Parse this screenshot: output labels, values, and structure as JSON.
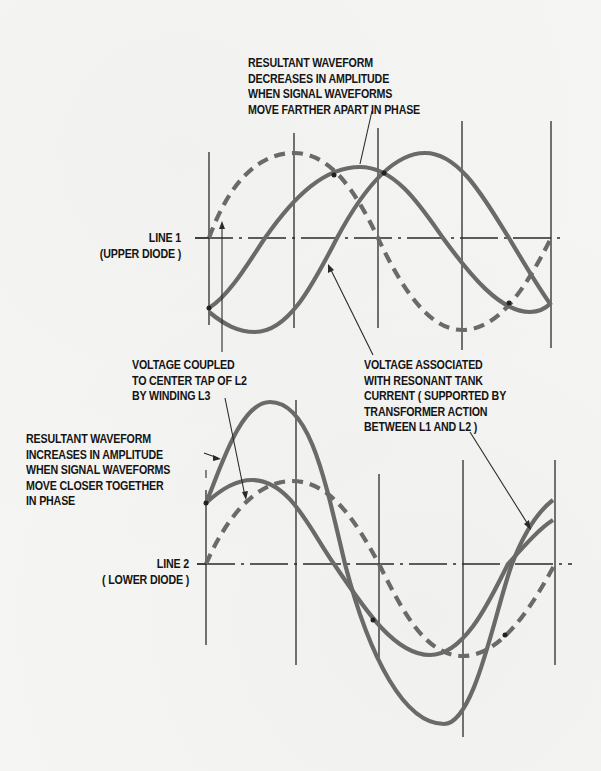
{
  "diagram": {
    "upper_graph": {
      "line_label": "LINE 1",
      "line_sublabel": "(UPPER DIODE )"
    },
    "lower_graph": {
      "line_label": "LINE 2",
      "line_sublabel": "( LOWER DIODE )"
    },
    "annotations": {
      "decreases": [
        "RESULTANT WAVEFORM",
        "DECREASES IN AMPLITUDE",
        "WHEN SIGNAL WAVEFORMS",
        "MOVE FARTHER APART IN PHASE"
      ],
      "coupled": [
        "VOLTAGE COUPLED",
        "TO CENTER TAP OF L2",
        "BY WINDING L3"
      ],
      "tank": [
        "VOLTAGE ASSOCIATED",
        "WITH RESONANT TANK",
        "CURRENT ( SUPPORTED BY",
        "TRANSFORMER ACTION",
        "BETWEEN L1 AND L2 )"
      ],
      "increases": [
        "RESULTANT WAVEFORM",
        "INCREASES IN AMPLITUDE",
        "WHEN SIGNAL WAVEFORMS",
        "MOVE CLOSER TOGETHER",
        "IN PHASE"
      ]
    },
    "colors": {
      "background": "#f5f5f3",
      "curve": "#6a6a6a",
      "gridline": "#2a2a2a",
      "text": "#151515"
    }
  }
}
